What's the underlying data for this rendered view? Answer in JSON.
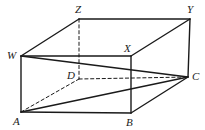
{
  "figure": {
    "type": "geometry-diagram",
    "shape": "rectangular-prism",
    "stroke_color": "#1a1a1a",
    "background_color": "#ffffff",
    "vertices": [
      {
        "id": "W",
        "label": "W",
        "x": 21,
        "y": 56,
        "label_x": 7,
        "label_y": 50,
        "hidden": false
      },
      {
        "id": "Z",
        "label": "Z",
        "x": 79,
        "y": 19,
        "label_x": 75,
        "label_y": 4,
        "hidden": false
      },
      {
        "id": "Y",
        "label": "Y",
        "x": 190,
        "y": 19,
        "label_x": 187,
        "label_y": 4,
        "hidden": false
      },
      {
        "id": "X",
        "label": "X",
        "x": 131,
        "y": 56,
        "label_x": 124,
        "label_y": 43,
        "hidden": false
      },
      {
        "id": "A",
        "label": "A",
        "x": 21,
        "y": 112,
        "label_x": 13,
        "label_y": 116,
        "hidden": false
      },
      {
        "id": "D",
        "label": "D",
        "x": 79,
        "y": 79,
        "label_x": 67,
        "label_y": 70,
        "hidden": true
      },
      {
        "id": "C",
        "label": "C",
        "x": 188,
        "y": 77,
        "label_x": 192,
        "label_y": 71,
        "hidden": false
      },
      {
        "id": "B",
        "label": "B",
        "x": 131,
        "y": 113,
        "label_x": 126,
        "label_y": 117,
        "hidden": false
      }
    ],
    "edges": [
      {
        "from": "W",
        "to": "Z",
        "style": "solid",
        "name": "edge-w-z"
      },
      {
        "from": "Z",
        "to": "Y",
        "style": "solid",
        "name": "edge-z-y"
      },
      {
        "from": "Y",
        "to": "X",
        "style": "solid",
        "name": "edge-y-x"
      },
      {
        "from": "X",
        "to": "W",
        "style": "solid",
        "name": "edge-x-w"
      },
      {
        "from": "W",
        "to": "A",
        "style": "solid",
        "name": "edge-w-a"
      },
      {
        "from": "X",
        "to": "B",
        "style": "solid",
        "name": "edge-x-b"
      },
      {
        "from": "Y",
        "to": "C",
        "style": "solid",
        "name": "edge-y-c"
      },
      {
        "from": "Z",
        "to": "D",
        "style": "dashed",
        "name": "edge-z-d-hidden"
      },
      {
        "from": "A",
        "to": "B",
        "style": "solid",
        "name": "edge-a-b"
      },
      {
        "from": "B",
        "to": "C",
        "style": "solid",
        "name": "edge-b-c"
      },
      {
        "from": "D",
        "to": "C",
        "style": "dashed",
        "name": "edge-d-c-hidden"
      },
      {
        "from": "A",
        "to": "D",
        "style": "dashed",
        "name": "edge-a-d-hidden"
      }
    ],
    "diagonals": [
      {
        "from": "W",
        "to": "C",
        "style": "solid",
        "name": "diagonal-w-c"
      },
      {
        "from": "A",
        "to": "C",
        "style": "solid",
        "name": "diagonal-a-c"
      }
    ]
  }
}
